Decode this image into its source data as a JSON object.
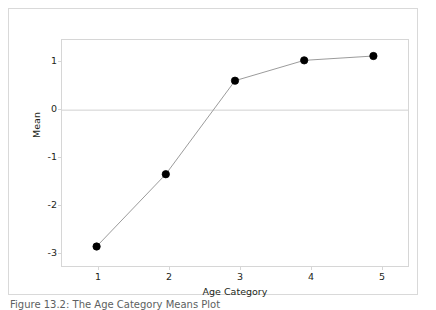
{
  "figure": {
    "caption": "Figure 13.2:  The Age Category Means Plot",
    "background_color": "#ffffff",
    "frame_color": "#d9d9d9"
  },
  "chart_data": {
    "type": "line",
    "title": "",
    "xlabel": "Age Category",
    "ylabel": "Mean",
    "x": [
      1,
      2,
      3,
      4,
      5
    ],
    "values": [
      -3.15,
      -1.48,
      0.68,
      1.15,
      1.25
    ],
    "series": [
      {
        "name": "Mean",
        "values": [
          -3.15,
          -1.48,
          0.68,
          1.15,
          1.25
        ]
      }
    ],
    "xlim": [
      0.5,
      5.5
    ],
    "ylim": [
      -3.6,
      1.62
    ],
    "xticks": [
      "1",
      "2",
      "3",
      "4",
      "5"
    ],
    "yticks": [
      "1",
      "0",
      "-1",
      "-2",
      "-3"
    ],
    "ytick_values": [
      1,
      0,
      -1,
      -2,
      -3
    ],
    "grid": false,
    "legend": "none",
    "reference_line": {
      "orientation": "horizontal",
      "value": 0,
      "color": "#d0d0d0"
    },
    "marker": {
      "shape": "circle",
      "filled": true,
      "color": "#000000",
      "size": 5
    },
    "line": {
      "color": "#9a9a9a",
      "width": 1
    }
  }
}
